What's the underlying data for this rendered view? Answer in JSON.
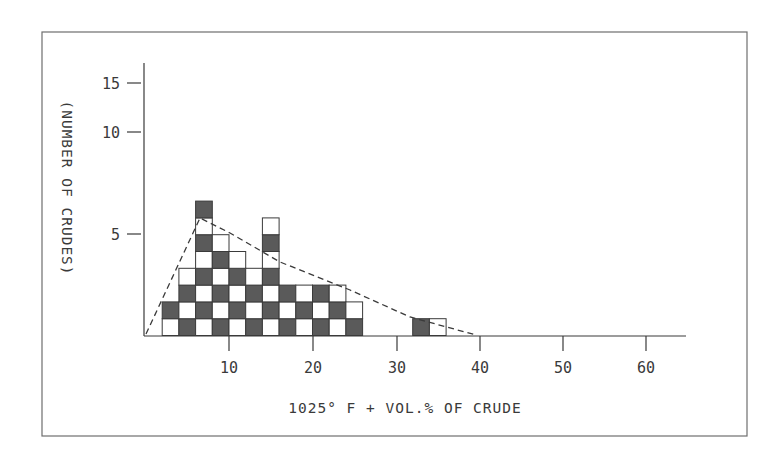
{
  "chart_data": {
    "type": "bar",
    "subtype": "histogram",
    "title": "",
    "xlabel": "1025° F + VOL.% OF CRUDE",
    "ylabel": "(NUMBER OF CRUDES)",
    "x_ticks": [
      10,
      20,
      30,
      40,
      50,
      60
    ],
    "x_tick_labels": [
      "10",
      "20",
      "30",
      "40",
      "50",
      "60"
    ],
    "y_ticks": [
      5,
      10,
      15
    ],
    "y_tick_labels": [
      "5",
      "10",
      "15"
    ],
    "xlim": [
      0,
      65
    ],
    "grid": false,
    "legend": null,
    "bin_width": 2,
    "bins": [
      {
        "x0": 2,
        "x1": 4,
        "count": 2
      },
      {
        "x0": 4,
        "x1": 6,
        "count": 4
      },
      {
        "x0": 6,
        "x1": 8,
        "count": 8
      },
      {
        "x0": 8,
        "x1": 10,
        "count": 6
      },
      {
        "x0": 10,
        "x1": 12,
        "count": 5
      },
      {
        "x0": 12,
        "x1": 14,
        "count": 4
      },
      {
        "x0": 14,
        "x1": 16,
        "count": 7
      },
      {
        "x0": 16,
        "x1": 18,
        "count": 3
      },
      {
        "x0": 18,
        "x1": 20,
        "count": 3
      },
      {
        "x0": 20,
        "x1": 22,
        "count": 3
      },
      {
        "x0": 22,
        "x1": 24,
        "count": 3
      },
      {
        "x0": 24,
        "x1": 26,
        "count": 2
      },
      {
        "x0": 32,
        "x1": 34,
        "count": 1
      },
      {
        "x0": 34,
        "x1": 36,
        "count": 1
      }
    ],
    "categories": [
      "2-4",
      "4-6",
      "6-8",
      "8-10",
      "10-12",
      "12-14",
      "14-16",
      "16-18",
      "18-20",
      "20-22",
      "22-24",
      "24-26",
      "32-34",
      "34-36"
    ],
    "values": [
      2,
      4,
      8,
      6,
      5,
      4,
      7,
      3,
      3,
      3,
      3,
      2,
      1,
      1
    ],
    "fitted_distribution": {
      "style": "dashed",
      "points": [
        [
          0,
          0
        ],
        [
          7,
          7
        ],
        [
          40,
          0
        ]
      ],
      "description": "Skewed distribution curve rising from 0 to a peak near 7% and tailing off to ~39%"
    },
    "fill_pattern": "alternating checkerboard of dark hatched and white cells"
  }
}
